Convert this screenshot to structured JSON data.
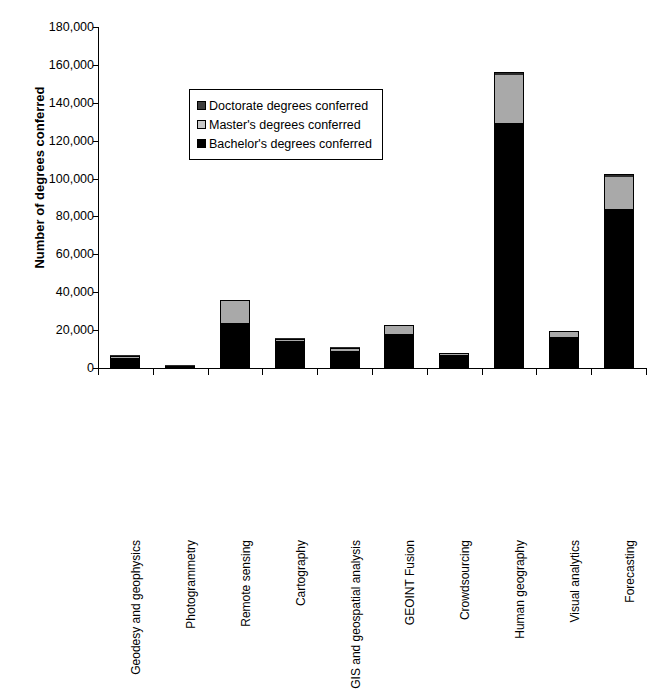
{
  "chart_data": {
    "type": "bar",
    "subtype": "stacked",
    "title": "",
    "xlabel": "",
    "ylabel": "Number of degrees conferred",
    "ylim": [
      0,
      180000
    ],
    "ytick_step": 20000,
    "ytick_labels": [
      "180,000",
      "160,000",
      "140,000",
      "120,000",
      "100,000",
      "80,000",
      "60,000",
      "40,000",
      "20,000",
      "0"
    ],
    "ytick_values": [
      180000,
      160000,
      140000,
      120000,
      100000,
      80000,
      60000,
      40000,
      20000,
      0
    ],
    "grid": false,
    "legend_position": "inside-upper-left",
    "categories": [
      "Geodesy and geophysics",
      "Photogrammetry",
      "Remote sensing",
      "Cartography",
      "GIS and geospatial analysis",
      "GEOINT Fusion",
      "Crowdsourcing",
      "Human geography",
      "Visual analytics",
      "Forecasting"
    ],
    "series": [
      {
        "name": "Bachelor's degrees conferred",
        "color": "#000000",
        "values": [
          5500,
          400,
          24000,
          14000,
          9000,
          18000,
          6800,
          129500,
          16500,
          84000
        ]
      },
      {
        "name": "Master's degrees conferred",
        "color": "#a9a9a9",
        "values": [
          700,
          100,
          11500,
          1200,
          1500,
          4200,
          800,
          25000,
          2500,
          17000
        ]
      },
      {
        "name": "Doctorate degrees conferred",
        "color": "#2b2b2b",
        "values": [
          200,
          50,
          500,
          200,
          200,
          400,
          200,
          1500,
          300,
          1200
        ]
      }
    ],
    "totals": [
      6400,
      550,
      36000,
      15400,
      10700,
      22600,
      7800,
      156000,
      19300,
      102200
    ]
  },
  "legend": {
    "items": [
      {
        "label": "Doctorate degrees conferred",
        "swatch": "doctorate-swatch"
      },
      {
        "label": "Master's degrees conferred",
        "swatch": "masters-swatch"
      },
      {
        "label": "Bachelor's degrees conferred",
        "swatch": "bachelors-swatch"
      }
    ]
  }
}
